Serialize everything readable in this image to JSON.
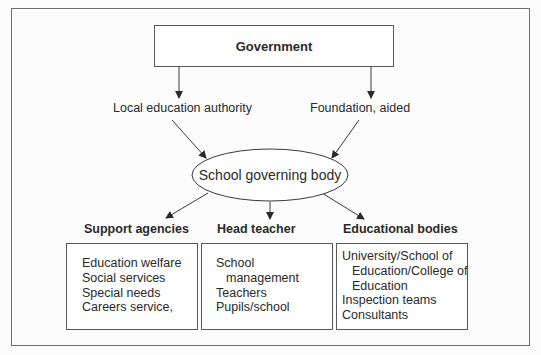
{
  "diagram": {
    "top": {
      "label": "Government"
    },
    "routes": [
      {
        "label": "Local education authority"
      },
      {
        "label": "Foundation, aided"
      }
    ],
    "center": {
      "label": "School governing body"
    },
    "branches": [
      {
        "header": "Support agencies",
        "items": [
          "Education welfare",
          "Social services",
          "Special needs",
          "Careers service,"
        ]
      },
      {
        "header": "Head teacher",
        "items": [
          "School",
          "management",
          "Teachers",
          "Pupils/school"
        ]
      },
      {
        "header": "Educational bodies",
        "items": [
          "University/School of",
          "Education/College of",
          "Education",
          "Inspection teams",
          "Consultants"
        ]
      }
    ]
  },
  "colors": {
    "line": "#3a3a3a",
    "border": "#5a5a5a",
    "text": "#2a2a2a"
  }
}
